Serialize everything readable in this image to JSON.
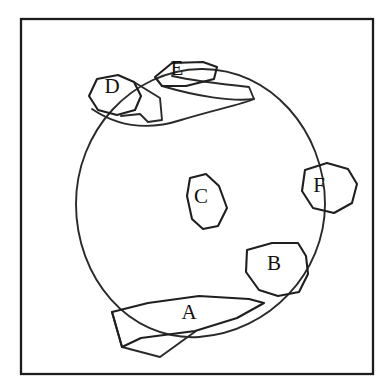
{
  "figure": {
    "background_color": "#ffffff",
    "ink_color": "#1f1f1f",
    "frame": {
      "name": "outer-border",
      "x": 21,
      "y": 19,
      "width": 352,
      "height": 355,
      "stroke_color": "#1c1c1c",
      "stroke_width": 2.3
    },
    "circle": {
      "name": "main-circle",
      "center_x": 201,
      "center_y": 203,
      "radius": 134,
      "stroke_color": "#2a2a2a",
      "stroke_width": 1.9,
      "path": "M 325 204 C 325 272 270 332 199 337 C 128 341 76 277 76 204 C 76 131 132 70 201 69 C 270 68 325 131 325 204 Z"
    },
    "regions": [
      {
        "id": "A",
        "label": "A",
        "label_x": 189,
        "label_y": 314,
        "points": "148,303 199,296 249,299 264,303 237,318 195,331 141,338 122,347 112,312",
        "note": "elongated quadrilateral-like band crossing the lower circle boundary"
      },
      {
        "id": "B",
        "label": "B",
        "label_x": 274,
        "label_y": 265,
        "points": "247,250 272,243 298,243 306,256 308,274 299,292 278,296 259,290 246,272"
      },
      {
        "id": "C",
        "label": "C",
        "label_x": 201,
        "label_y": 198,
        "points": "190,178 206,174 219,186 227,208 218,226 203,229 192,219 187,196"
      },
      {
        "id": "D",
        "label": "D",
        "label_x": 112,
        "label_y": 88,
        "points": "97,79 118,75 134,82 141,96 135,110 117,115 98,110 89,96"
      },
      {
        "id": "E",
        "label": "E",
        "label_x": 177,
        "label_y": 70,
        "points": "155,77 172,63 203,62 217,67 214,79 186,86 162,86"
      },
      {
        "id": "F",
        "label": "F",
        "label_x": 319,
        "label_y": 187,
        "points": "305,170 327,163 348,169 357,184 352,203 334,213 313,208 302,191"
      }
    ],
    "extra_strokes": [
      {
        "name": "stroke-upper-sweep",
        "path": "M 92 109 C 120 128 150 130 181 120 C 214 110 243 104 254 99"
      },
      {
        "name": "stroke-d-tail",
        "path": "M 134 82 L 160 98 L 162 120 L 148 122 L 140 114 L 121 116"
      },
      {
        "name": "stroke-e-band",
        "path": "M 162 86 C 196 96 232 102 254 99 L 249 87 C 221 84 190 80 172 76"
      },
      {
        "name": "stroke-a-lower",
        "path": "M 112 312 L 122 347 L 160 357 L 196 331"
      }
    ]
  }
}
